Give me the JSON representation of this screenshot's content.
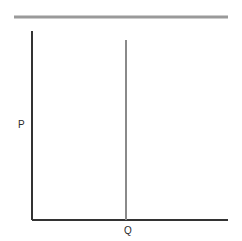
{
  "figure": {
    "width": 242,
    "height": 241,
    "background_color": "#ffffff"
  },
  "labels": {
    "y_axis": "P",
    "x_axis": "Q"
  },
  "colors": {
    "axis": "#333333",
    "demand_line": "#9a9a9a",
    "supply_line": "#8a8a8a",
    "background": "#ffffff",
    "text": "#2b2b2b"
  },
  "chart_data": {
    "type": "line",
    "title": "",
    "subtitle": "",
    "xlabel": "Q",
    "ylabel": "P",
    "grid": false,
    "legend": false,
    "xlim": [
      0,
      100
    ],
    "ylim": [
      0,
      100
    ],
    "axes": {
      "origin_px": [
        32,
        220
      ],
      "y_axis_top_px": [
        32,
        31
      ],
      "x_axis_right_px": [
        228,
        220
      ],
      "stroke_width": 2,
      "color": "#333333"
    },
    "series": [
      {
        "name": "Perfectly elastic line",
        "type": "horizontal-line",
        "orientation": "horizontal",
        "color": "#9a9a9a",
        "stroke_width": 3,
        "y_value_px": 17,
        "x_start_px": 14,
        "x_end_px": 228,
        "points": [
          [
            14,
            17
          ],
          [
            228,
            17
          ]
        ]
      },
      {
        "name": "Perfectly inelastic line",
        "type": "vertical-line",
        "orientation": "vertical",
        "color": "#8a8a8a",
        "stroke_width": 2,
        "x_value_px": 126,
        "y_start_px": 40,
        "y_end_px": 220,
        "points": [
          [
            126,
            40
          ],
          [
            126,
            220
          ]
        ]
      }
    ],
    "annotations": [
      {
        "text": "P",
        "x_px": 22,
        "y_px": 125,
        "role": "y-axis-label"
      },
      {
        "text": "Q",
        "x_px": 128,
        "y_px": 231,
        "role": "x-axis-label"
      }
    ]
  }
}
